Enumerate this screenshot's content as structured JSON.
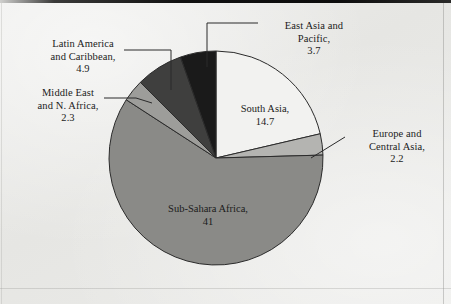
{
  "chart_data": {
    "type": "pie",
    "title": "",
    "categories": [
      "South Asia",
      "Europe and Central Asia",
      "Sub-Sahara Africa",
      "Middle East and N. Africa",
      "Latin America and Caribbean",
      "East Asia and Pacific"
    ],
    "values": [
      14.7,
      2.2,
      41,
      2.3,
      4.9,
      3.7
    ],
    "total": 68.8,
    "start_angle_deg": 0,
    "direction": "clockwise",
    "legend": "none",
    "labels_position": "inside-and-callout",
    "slice_colors": [
      "#f2f2f0",
      "#b4b4b1",
      "#8a8a87",
      "#9d9d9a",
      "#3f3f3e",
      "#1a1a1a"
    ],
    "slices": [
      {
        "name": "South Asia",
        "value": 14.7,
        "label_text": "South Asia,\n14.7",
        "color": "#f2f2f0",
        "label_kind": "inside"
      },
      {
        "name": "Europe and Central Asia",
        "value": 2.2,
        "label_text": "Europe and\nCentral Asia,\n2.2",
        "color": "#b4b4b1",
        "label_kind": "callout"
      },
      {
        "name": "Sub-Sahara Africa",
        "value": 41,
        "label_text": "Sub-Sahara Africa,\n41",
        "color": "#8a8a87",
        "label_kind": "inside"
      },
      {
        "name": "Middle East and N. Africa",
        "value": 2.3,
        "label_text": "Middle East\nand N. Africa,\n2.3",
        "color": "#9d9d9a",
        "label_kind": "callout"
      },
      {
        "name": "Latin America and Caribbean",
        "value": 4.9,
        "label_text": "Latin America\nand Caribbean,\n4.9",
        "color": "#3f3f3e",
        "label_kind": "callout"
      },
      {
        "name": "East Asia and Pacific",
        "value": 3.7,
        "label_text": "East Asia and\nPacific,\n3.7",
        "color": "#1a1a1a",
        "label_kind": "callout"
      }
    ],
    "geometry": {
      "center_x": 216,
      "center_y": 158,
      "radius": 107
    },
    "background_color": "#e9e9e7",
    "outline_color": "#2b2b2b"
  },
  "labels": {
    "east_asia": "East Asia and\nPacific,\n3.7",
    "latin_america": "Latin America\nand Caribbean,\n4.9",
    "middle_east": "Middle East\nand N. Africa,\n2.3",
    "europe": "Europe and\nCentral Asia,\n2.2",
    "south_asia": "South Asia,\n14.7",
    "sub_sahara": "Sub-Sahara Africa,\n41"
  }
}
